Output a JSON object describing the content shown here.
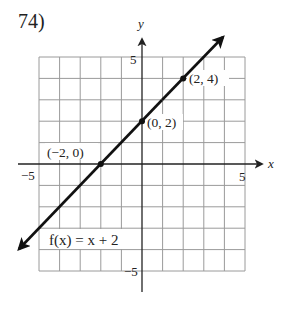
{
  "problem": {
    "number": "74)"
  },
  "chart_data": {
    "type": "line",
    "title": "",
    "function_label": "f(x) = x + 2",
    "xlabel": "x",
    "ylabel": "y",
    "xlim": [
      -5,
      5
    ],
    "ylim": [
      -5,
      5
    ],
    "grid": true,
    "grid_step": 1,
    "tick_labels": {
      "x": [
        {
          "value": -5,
          "label": "−5"
        },
        {
          "value": 5,
          "label": "5"
        }
      ],
      "y": [
        {
          "value": 5,
          "label": "5"
        },
        {
          "value": -5,
          "label": "−5"
        }
      ]
    },
    "series": [
      {
        "name": "f(x) = x + 2",
        "slope": 1,
        "intercept": 2,
        "x": [
          -6,
          4
        ],
        "y": [
          -4,
          6
        ],
        "arrows": "both"
      }
    ],
    "points": [
      {
        "x": -2,
        "y": 0,
        "label": "(−2, 0)"
      },
      {
        "x": 0,
        "y": 2,
        "label": "(0, 2)"
      },
      {
        "x": 2,
        "y": 4,
        "label": "(2, 4)"
      }
    ]
  }
}
